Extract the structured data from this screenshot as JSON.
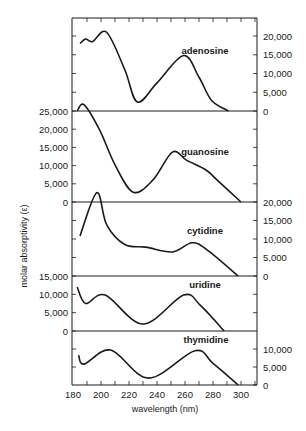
{
  "chart_data": {
    "type": "line",
    "title": "",
    "xlabel": "wavelength (nm)",
    "ylabel": "molar absorptivity (ε)",
    "xlim": [
      180,
      311
    ],
    "x_ticks": [
      180,
      200,
      220,
      240,
      260,
      280,
      300
    ],
    "x_minor_step": 10,
    "grid": false,
    "legend": "none (curves labeled inline)",
    "panels": [
      {
        "name": "adenosine",
        "axis_side": "right",
        "ylim": [
          0,
          22000
        ],
        "y_ticks": [
          0,
          5000,
          10000,
          15000,
          20000
        ],
        "y_tick_labels": [
          "0",
          "5,000",
          "10,000",
          "15,000",
          "20,000"
        ],
        "x": [
          185,
          189,
          194,
          204,
          217,
          226,
          240,
          259,
          270,
          279,
          291
        ],
        "values": [
          18000,
          19200,
          18500,
          21000,
          11000,
          2400,
          7500,
          14800,
          9000,
          2800,
          0
        ]
      },
      {
        "name": "guanosine",
        "axis_side": "left",
        "ylim": [
          0,
          25000
        ],
        "y_ticks": [
          0,
          5000,
          10000,
          15000,
          20000,
          25000
        ],
        "y_tick_labels": [
          "0",
          "5,000",
          "10,000",
          "15,000",
          "20,000",
          "25,000"
        ],
        "x": [
          183,
          188,
          199,
          210,
          223,
          237,
          251,
          261,
          275,
          283,
          300
        ],
        "values": [
          25000,
          26700,
          19800,
          10200,
          2700,
          6000,
          13700,
          11500,
          8800,
          6000,
          0
        ]
      },
      {
        "name": "cytidine",
        "axis_side": "right",
        "ylim": [
          0,
          20000
        ],
        "y_ticks": [
          0,
          5000,
          10000,
          15000,
          20000
        ],
        "y_tick_labels": [
          "0",
          "5,000",
          "10,000",
          "15,000",
          "20,000"
        ],
        "x": [
          185,
          197,
          204,
          217,
          232,
          251,
          265,
          276,
          298
        ],
        "values": [
          10800,
          22500,
          13900,
          8500,
          7800,
          6500,
          9000,
          7000,
          0
        ]
      },
      {
        "name": "uridine",
        "axis_side": "left",
        "ylim": [
          0,
          15000
        ],
        "y_ticks": [
          0,
          5000,
          10000,
          15000
        ],
        "y_tick_labels": [
          "0",
          "5,000",
          "10,000",
          "15,000"
        ],
        "x": [
          183,
          189,
          203,
          230,
          259,
          271,
          288
        ],
        "values": [
          12000,
          7500,
          9800,
          1900,
          9800,
          7000,
          0
        ]
      },
      {
        "name": "thymidine",
        "axis_side": "right",
        "ylim": [
          0,
          10000
        ],
        "y_ticks": [
          0,
          5000,
          10000
        ],
        "y_tick_labels": [
          "0",
          "5,000",
          "10,000"
        ],
        "x": [
          184,
          188,
          207,
          234,
          267,
          280,
          298
        ],
        "values": [
          8300,
          5800,
          9700,
          1900,
          9500,
          6000,
          0
        ]
      }
    ]
  },
  "labels": {
    "xlabel": "wavelength (nm)",
    "ylabel": "molar absorptivity (ε)"
  }
}
